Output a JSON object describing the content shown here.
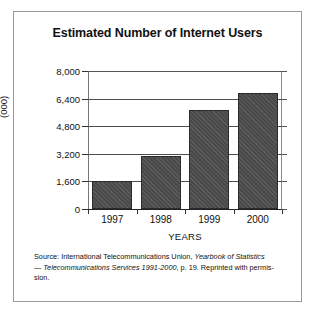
{
  "chart_data": {
    "type": "bar",
    "title": "Estimated Number of Internet Users",
    "xlabel": "YEARS",
    "ylabel": "(000)",
    "categories": [
      "1997",
      "1998",
      "1999",
      "2000"
    ],
    "values": [
      1600,
      3050,
      5750,
      6700
    ],
    "ylim": [
      0,
      8000
    ],
    "yticks": [
      0,
      1600,
      3200,
      4800,
      6400,
      8000
    ],
    "ytick_labels": [
      "0",
      "1,600",
      "3,200",
      "4,800",
      "6,400",
      "8,000"
    ],
    "grid": true,
    "legend": null,
    "bar_color": "#4a4a4a",
    "series": [
      {
        "name": "Estimated Number of Internet Users",
        "values": [
          1600,
          3050,
          5750,
          6700
        ]
      }
    ]
  },
  "source": {
    "line1_prefix": "Source: International Telecommunications Union, ",
    "line1_italic": "Yearbook of Statistics",
    "line2_italic": "— Telecommunications Services 1991-2000",
    "line2_suffix": ", p. 19. Reprinted with permis-",
    "line3": "sion."
  }
}
